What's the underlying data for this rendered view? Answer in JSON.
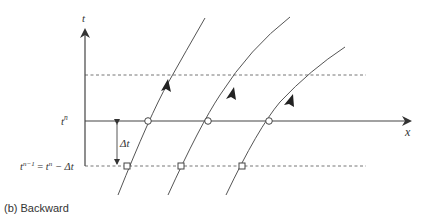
{
  "figure": {
    "caption": "(b) Backward",
    "axes": {
      "t_label": "t",
      "x_label": "x"
    },
    "labels": {
      "t_n_base": "t",
      "t_n_sup": "n",
      "t_nm1_base": "t",
      "t_nm1_sup": "n−1",
      "equals": " = ",
      "t_n2_base": "t",
      "t_n2_sup": "n",
      "minus_dt": " − Δt",
      "delta_t": "Δt"
    },
    "colors": {
      "line": "#555555",
      "dashed": "#777777",
      "background": "#ffffff"
    },
    "markers": {
      "departure_points": "square",
      "arrival_points": "circle",
      "count": 3
    }
  }
}
